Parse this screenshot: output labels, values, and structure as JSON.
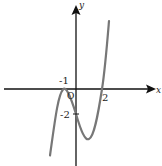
{
  "figure": {
    "axes": {
      "x_label": "x",
      "y_label": "y",
      "origin_label": "O"
    },
    "ticks": {
      "x_neg1": "-1",
      "x_2": "2",
      "y_neg2": "-2"
    },
    "curve": {
      "description": "cubic y = (x+1)^2 (x-2)",
      "color": "#777777",
      "key_points": [
        {
          "x": -1,
          "y": 0,
          "note": "touches x-axis (local max)"
        },
        {
          "x": 0,
          "y": -2,
          "note": "y-intercept"
        },
        {
          "x": 2,
          "y": 0,
          "note": "crosses x-axis"
        }
      ]
    },
    "axis_color": "#111111"
  }
}
